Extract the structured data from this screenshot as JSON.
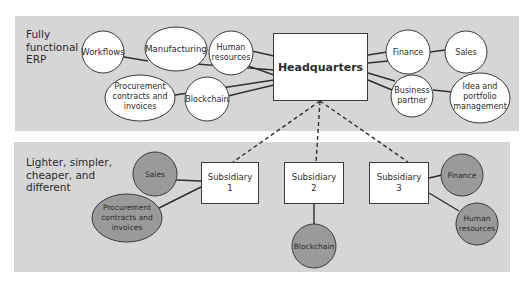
{
  "panels": {
    "top": {
      "label": "Fully\nfunctional\nERP"
    },
    "bottom": {
      "label": "Lighter, simpler,\ncheaper, and\ndifferent"
    }
  },
  "colors": {
    "panel_bg": "#d6d6d6",
    "node_light": "#ffffff",
    "node_dark": "#9a9a9a",
    "line": "#2e2e2e"
  },
  "headquarters": {
    "label": "Headquarters"
  },
  "top_nodes": [
    {
      "id": "workflows",
      "lines": [
        "Workflows"
      ]
    },
    {
      "id": "manufacturing",
      "lines": [
        "Manufacturing"
      ]
    },
    {
      "id": "human-resources",
      "lines": [
        "Human",
        "resources"
      ]
    },
    {
      "id": "procurement",
      "lines": [
        "Procurement",
        "contracts and",
        "invoices"
      ]
    },
    {
      "id": "blockchain",
      "lines": [
        "Blockchain"
      ]
    },
    {
      "id": "finance",
      "lines": [
        "Finance"
      ]
    },
    {
      "id": "sales",
      "lines": [
        "Sales"
      ]
    },
    {
      "id": "business-partner",
      "lines": [
        "Business",
        "partner"
      ]
    },
    {
      "id": "idea-portfolio",
      "lines": [
        "Idea and",
        "portfolio",
        "management"
      ]
    }
  ],
  "subsidiaries": [
    {
      "id": "subsidiary-1",
      "lines": [
        "Subsidiary",
        "1"
      ]
    },
    {
      "id": "subsidiary-2",
      "lines": [
        "Subsidiary",
        "2"
      ]
    },
    {
      "id": "subsidiary-3",
      "lines": [
        "Subsidiary",
        "3"
      ]
    }
  ],
  "bottom_nodes": [
    {
      "id": "sub1-sales",
      "lines": [
        "Sales"
      ]
    },
    {
      "id": "sub1-procurement",
      "lines": [
        "Procurement",
        "contracts and",
        "invoices"
      ]
    },
    {
      "id": "sub2-blockchain",
      "lines": [
        "Blockchain"
      ]
    },
    {
      "id": "sub3-finance",
      "lines": [
        "Finance"
      ]
    },
    {
      "id": "sub3-human-resources",
      "lines": [
        "Human",
        "resources"
      ]
    }
  ]
}
